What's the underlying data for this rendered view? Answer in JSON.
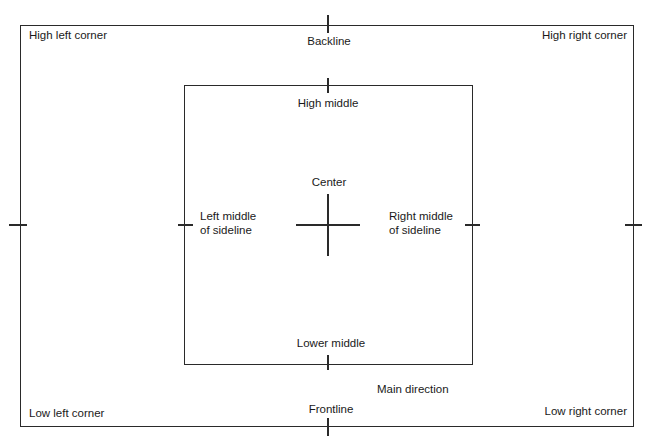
{
  "diagram": {
    "outer_area": {
      "corners": {
        "high_left": "High left corner",
        "high_right": "High right corner",
        "low_left": "Low left corner",
        "low_right": "Low right corner"
      },
      "backline": "Backline",
      "frontline": "Frontline"
    },
    "inner_area": {
      "high_middle": "High middle",
      "lower_middle": "Lower middle",
      "left_middle_line1": "Left middle",
      "left_middle_line2": "of sideline",
      "right_middle_line1": "Right middle",
      "right_middle_line2": "of sideline"
    },
    "center": "Center",
    "main_direction": "Main direction"
  }
}
